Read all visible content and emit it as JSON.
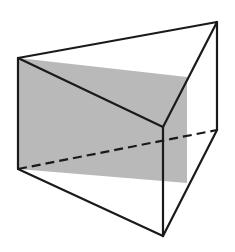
{
  "figure": {
    "type": "triangular-prism",
    "colors": {
      "background": "#ffffff",
      "edge": "#1a1a1a",
      "section_fill": "#b9b9b9",
      "section_edge": "#9a9a9a"
    },
    "vertices": {
      "top_left": [
        18,
        58
      ],
      "top_right_back": [
        217,
        22
      ],
      "top_front": [
        163,
        127
      ],
      "bottom_left": [
        18,
        169
      ],
      "bottom_right_back": [
        217,
        130
      ],
      "bottom_front": [
        163,
        236
      ]
    },
    "section_plane": {
      "points": [
        [
          18,
          58
        ],
        [
          187,
          77
        ],
        [
          187,
          183
        ],
        [
          18,
          169
        ]
      ]
    },
    "hidden_edge": {
      "from": [
        18,
        169
      ],
      "to": [
        217,
        130
      ],
      "dash": "9 5"
    }
  }
}
